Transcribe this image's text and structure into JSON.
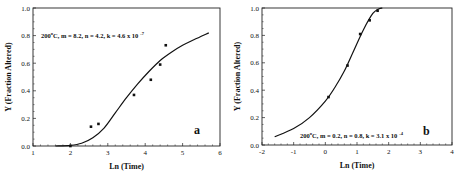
{
  "chart_data": [
    {
      "type": "line",
      "panel_label": "a",
      "title": "",
      "annotation": "200°C, m = 8.2, n = 4.2, k = 4.6 x 10⁻⁷",
      "annotation_main": "200",
      "annotation_sup": "o",
      "annotation_rest": "C, m = 8.2, n = 4.2, k = 4.6 x 10",
      "annotation_exp": "-7",
      "xlabel": "Ln (Time)",
      "ylabel": "Y (Fraction Altered)",
      "xlim": [
        1,
        6
      ],
      "ylim": [
        0,
        1.0
      ],
      "xticks": [
        "1",
        "2",
        "3",
        "4",
        "5",
        "6"
      ],
      "yticks": [
        "0.0",
        "0.2",
        "0.4",
        "0.6",
        "0.8",
        "1.0"
      ],
      "grid": false,
      "series": [
        {
          "name": "fit",
          "kind": "line",
          "x": [
            1.6,
            2.0,
            2.3,
            2.6,
            2.9,
            3.2,
            3.5,
            3.8,
            4.1,
            4.4,
            4.7,
            5.0,
            5.3,
            5.7
          ],
          "y": [
            0.0,
            0.005,
            0.02,
            0.06,
            0.13,
            0.24,
            0.35,
            0.45,
            0.54,
            0.62,
            0.68,
            0.73,
            0.77,
            0.82
          ]
        },
        {
          "name": "data",
          "kind": "scatter",
          "x": [
            2.0,
            2.55,
            2.75,
            3.7,
            4.15,
            4.4,
            4.55
          ],
          "y": [
            0.0,
            0.14,
            0.16,
            0.37,
            0.48,
            0.59,
            0.73
          ]
        }
      ]
    },
    {
      "type": "line",
      "panel_label": "b",
      "title": "",
      "annotation": "200°C, m = 0.2, n = 0.8, k = 3.1 x 10⁻⁴",
      "annotation_main": "200",
      "annotation_sup": "o",
      "annotation_rest": "C, m = 0.2, n = 0.8, k = 3.1 x 10",
      "annotation_exp": "-4",
      "xlabel": "Ln (Time)",
      "ylabel": "Y (Fraction Altered)",
      "xlim": [
        -2,
        4
      ],
      "ylim": [
        0,
        1.0
      ],
      "xticks": [
        "-2",
        "-1",
        "0",
        "1",
        "2",
        "3",
        "4"
      ],
      "yticks": [
        "0.0",
        "0.2",
        "0.4",
        "0.6",
        "0.8",
        "1.0"
      ],
      "grid": false,
      "series": [
        {
          "name": "fit",
          "kind": "line",
          "x": [
            -1.6,
            -1.0,
            -0.5,
            0.0,
            0.3,
            0.6,
            0.9,
            1.2,
            1.5,
            1.7,
            1.8
          ],
          "y": [
            0.06,
            0.12,
            0.2,
            0.32,
            0.42,
            0.54,
            0.69,
            0.84,
            0.96,
            0.995,
            1.0
          ]
        },
        {
          "name": "data",
          "kind": "scatter",
          "x": [
            0.1,
            0.7,
            1.1,
            1.4,
            1.65
          ],
          "y": [
            0.35,
            0.58,
            0.81,
            0.91,
            0.98
          ]
        }
      ]
    }
  ]
}
